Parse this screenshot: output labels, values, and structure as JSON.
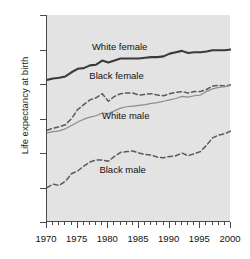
{
  "chart_data": {
    "type": "line",
    "title": "",
    "xlabel": "",
    "ylabel": "Life expectancy at birth",
    "xlim": [
      1970,
      2000
    ],
    "ylim": [
      55,
      85
    ],
    "grid": false,
    "legend_position": "inline-annotations",
    "y_ticks": [
      55,
      60,
      65,
      70,
      75,
      80,
      85
    ],
    "x_ticks": [
      1970,
      1975,
      1980,
      1985,
      1990,
      1995,
      2000
    ],
    "x_minor_tick_step": 1,
    "x": [
      1970,
      1971,
      1972,
      1973,
      1974,
      1975,
      1976,
      1977,
      1978,
      1979,
      1980,
      1981,
      1982,
      1983,
      1984,
      1985,
      1986,
      1987,
      1988,
      1989,
      1990,
      1991,
      1992,
      1993,
      1994,
      1995,
      1996,
      1997,
      1998,
      1999,
      2000
    ],
    "series": [
      {
        "name": "White female",
        "style": "solid-thick",
        "color": "#3a3a3a",
        "values": [
          75.6,
          75.8,
          75.9,
          76.1,
          76.7,
          77.2,
          77.3,
          77.7,
          77.8,
          78.4,
          78.1,
          78.4,
          78.7,
          78.7,
          78.7,
          78.7,
          78.8,
          78.9,
          78.9,
          79.0,
          79.4,
          79.6,
          79.8,
          79.5,
          79.6,
          79.6,
          79.7,
          79.9,
          79.9,
          79.9,
          80.0
        ]
      },
      {
        "name": "Black female",
        "style": "dashed",
        "color": "#5a5a5a",
        "values": [
          68.3,
          68.6,
          68.8,
          69.1,
          70.0,
          71.3,
          72.0,
          72.7,
          73.0,
          73.6,
          72.5,
          73.2,
          73.6,
          73.7,
          73.7,
          73.4,
          73.5,
          73.6,
          73.4,
          73.3,
          73.6,
          73.8,
          73.9,
          73.7,
          73.9,
          73.9,
          74.2,
          74.7,
          74.8,
          74.7,
          74.9
        ]
      },
      {
        "name": "White male",
        "style": "solid-thin",
        "color": "#8c8c8c",
        "values": [
          67.9,
          68.1,
          68.2,
          68.5,
          69.0,
          69.5,
          69.9,
          70.2,
          70.4,
          70.8,
          70.7,
          71.1,
          71.5,
          71.7,
          71.8,
          71.9,
          72.0,
          72.2,
          72.3,
          72.5,
          72.7,
          72.9,
          73.2,
          73.1,
          73.3,
          73.4,
          73.9,
          74.3,
          74.5,
          74.6,
          74.8
        ]
      },
      {
        "name": "Black male",
        "style": "dashed",
        "color": "#5a5a5a",
        "values": [
          60.0,
          60.5,
          60.3,
          60.9,
          62.0,
          62.4,
          63.1,
          63.7,
          64.0,
          64.0,
          63.8,
          64.5,
          65.1,
          65.2,
          65.3,
          65.0,
          64.8,
          64.7,
          64.4,
          64.3,
          64.5,
          64.6,
          65.0,
          64.6,
          64.9,
          65.2,
          66.1,
          67.2,
          67.6,
          67.8,
          68.2
        ]
      }
    ],
    "annotations": [
      {
        "text": "White female",
        "x": 1982.0,
        "y": 80.3
      },
      {
        "text": "Black female",
        "x": 1981.5,
        "y": 76.2
      },
      {
        "text": "White male",
        "x": 1983.0,
        "y": 70.4
      },
      {
        "text": "Black male",
        "x": 1982.5,
        "y": 62.6
      }
    ]
  }
}
